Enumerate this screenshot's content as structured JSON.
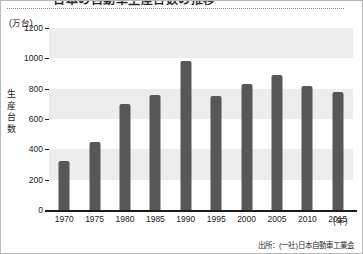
{
  "figure": {
    "title_cropped": "日本の自動車生産台数の推移",
    "source_note": "出所：(一社)日本自動車工業会",
    "bar_color": "#575757",
    "band_color": "#ededed",
    "background_color": "#ffffff",
    "axis_color": "#1d1d1d"
  },
  "chart_data": {
    "type": "bar",
    "title": "日本の自動車生産台数の推移",
    "xlabel": "(年)",
    "ylabel": "生産台数",
    "yunit": "(万台)",
    "ylim": [
      0,
      1200
    ],
    "ytick_labels": [
      "1200",
      "1000",
      "800",
      "600",
      "400",
      "200",
      "0"
    ],
    "ytick_values": [
      1200,
      1000,
      800,
      600,
      400,
      200,
      0
    ],
    "grid": "horizontal-bands",
    "legend": "none",
    "categories": [
      "1970",
      "1975",
      "1980",
      "1985",
      "1990",
      "1995",
      "2000",
      "2005",
      "2010",
      "2015"
    ],
    "values": [
      320,
      450,
      700,
      760,
      980,
      750,
      830,
      890,
      820,
      775
    ],
    "source": "出所：(一社)日本自動車工業会"
  }
}
